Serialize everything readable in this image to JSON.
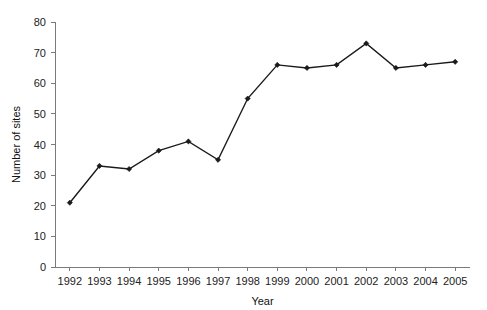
{
  "chart_data": {
    "type": "line",
    "title": "",
    "subtitle": "",
    "xlabel": "Year",
    "ylabel": "Number of sites",
    "categories": [
      "1992",
      "1993",
      "1994",
      "1995",
      "1996",
      "1997",
      "1998",
      "1999",
      "2000",
      "2001",
      "2002",
      "2003",
      "2004",
      "2005"
    ],
    "values": [
      21,
      33,
      32,
      38,
      41,
      35,
      55,
      66,
      65,
      66,
      73,
      65,
      66,
      67
    ],
    "series": [
      {
        "name": "Number of sites",
        "values": [
          21,
          33,
          32,
          38,
          41,
          35,
          55,
          66,
          65,
          66,
          73,
          65,
          66,
          67
        ]
      }
    ],
    "ylim": [
      0,
      80
    ],
    "ytick_labels": [
      "0",
      "10",
      "20",
      "30",
      "40",
      "50",
      "60",
      "70",
      "80"
    ],
    "ytick_values": [
      0,
      10,
      20,
      30,
      40,
      50,
      60,
      70,
      80
    ],
    "grid": false,
    "legend": false,
    "legend_position": "none",
    "line_color": "#1a1a1a",
    "marker_color": "#1a1a1a",
    "marker_shape": "diamond",
    "axis_color": "#7a7a7a",
    "background_color": "#ffffff"
  }
}
